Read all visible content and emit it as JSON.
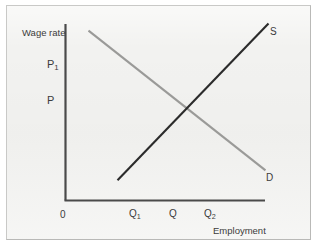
{
  "figure": {
    "kind": "economics-supply-demand-diagram",
    "background_color": "#f2f2f0",
    "frame_border_color": "#b9b9b7"
  },
  "axes": {
    "y_axis_title": "Wage rate",
    "x_axis_title": "Employment",
    "origin_label": "0",
    "axis_color": "#4a4a4a",
    "y_ticks": [
      {
        "label_main": "P",
        "label_sub": "1",
        "value": 1
      },
      {
        "label_main": "P",
        "label_sub": "",
        "value": 0
      }
    ],
    "x_ticks": [
      {
        "label_main": "Q",
        "label_sub": "1"
      },
      {
        "label_main": "Q",
        "label_sub": ""
      },
      {
        "label_main": "Q",
        "label_sub": "2"
      }
    ]
  },
  "curves": {
    "supply": {
      "label": "S",
      "color": "#2b2b2b"
    },
    "demand": {
      "label": "D",
      "color": "#9a9a98"
    }
  },
  "chart_data": {
    "type": "line",
    "title": "",
    "xlabel": "Employment",
    "ylabel": "Wage rate",
    "grid": false,
    "legend": "inline-curve-labels",
    "xlim": [
      0,
      10
    ],
    "ylim": [
      0,
      10
    ],
    "x_tick_labels": [
      "0",
      "Q1",
      "Q",
      "Q2"
    ],
    "x_tick_values": [
      0,
      3.4,
      5.4,
      7.15
    ],
    "y_tick_labels": [
      "P1",
      "P"
    ],
    "y_tick_values": [
      7.4,
      5.4
    ],
    "series": [
      {
        "name": "D",
        "label": "D",
        "role": "demand",
        "color": "#9a9a98",
        "x": [
          1.15,
          10.0
        ],
        "y": [
          9.6,
          1.7
        ]
      },
      {
        "name": "S",
        "label": "S",
        "role": "supply",
        "color": "#2b2b2b",
        "x": [
          2.6,
          10.15
        ],
        "y": [
          1.14,
          10.0
        ]
      }
    ],
    "annotations": [
      {
        "text": "equilibrium",
        "x": 5.4,
        "y": 5.4,
        "visible_text": false,
        "note": "intersection of S and D at (Q, P)"
      }
    ]
  }
}
